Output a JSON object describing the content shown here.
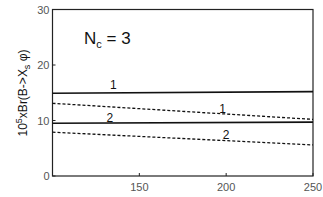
{
  "chart_data": {
    "type": "line",
    "title": "",
    "annotation": {
      "main": "N",
      "sub": "c",
      "rest": " = 3"
    },
    "xlabel": "",
    "ylabel": {
      "base": "10",
      "exp": "5",
      "mid": "xBr(B->X",
      "sub": "s",
      "end": " φ)"
    },
    "xlim": [
      100,
      250
    ],
    "ylim": [
      0,
      30
    ],
    "xticks": [
      150,
      200,
      250
    ],
    "yticks": [
      0,
      10,
      20,
      30
    ],
    "grid": false,
    "legend": "none (curves labeled inline)",
    "x": [
      100,
      250
    ],
    "series": [
      {
        "name": "1 (solid)",
        "label": "1",
        "style": "solid",
        "values": [
          14.9,
          15.2
        ]
      },
      {
        "name": "1 (dashed)",
        "label": "1",
        "style": "dashed",
        "values": [
          13.1,
          10.2
        ]
      },
      {
        "name": "2 (solid)",
        "label": "2",
        "style": "solid",
        "values": [
          9.5,
          9.7
        ]
      },
      {
        "name": "2 (dashed)",
        "label": "2",
        "style": "dashed",
        "values": [
          7.9,
          5.6
        ]
      }
    ],
    "inline_labels": [
      {
        "text": "1",
        "x": 135,
        "y": 16.4
      },
      {
        "text": "1",
        "x": 198,
        "y": 12.1
      },
      {
        "text": "2",
        "x": 133,
        "y": 10.5
      },
      {
        "text": "2",
        "x": 200,
        "y": 7.3
      }
    ]
  }
}
